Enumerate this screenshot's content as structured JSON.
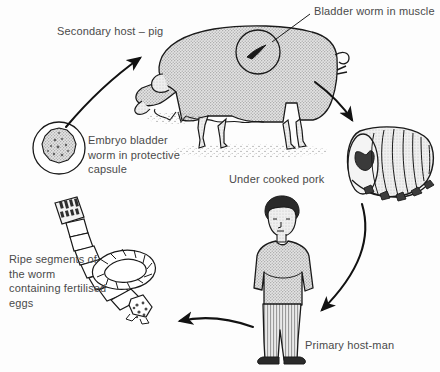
{
  "diagram": {
    "type": "cycle-diagram",
    "background_color": "#fdfdfd",
    "text_color": "#4a4a4a",
    "line_color": "#1a1a1a",
    "fill_color": "#d8d8d8",
    "labels": {
      "secondary_host": "Secondary host – pig",
      "bladder_worm": "Bladder worm in muscle",
      "embryo": "Embryo bladder\nworm in protective\ncapsule",
      "undercooked_pork": "Under cooked pork",
      "ripe_segments": "Ripe segments of\nthe worm\ncontaining fertilised\neggs",
      "primary_host": "Primary host-man"
    },
    "nodes": [
      {
        "id": "embryo-capsule",
        "label": "Embryo bladder worm in protective capsule",
        "shape": "circle"
      },
      {
        "id": "pig",
        "label": "Secondary host – pig",
        "shape": "animal"
      },
      {
        "id": "pork-joint",
        "label": "Under cooked pork",
        "shape": "meat-roll"
      },
      {
        "id": "man",
        "label": "Primary host-man",
        "shape": "person"
      },
      {
        "id": "tapeworm",
        "label": "Ripe segments of the worm containing fertilised eggs",
        "shape": "worm"
      }
    ],
    "arrows": [
      {
        "from": "embryo-capsule",
        "to": "pig",
        "direction": "up-right"
      },
      {
        "from": "pig",
        "to": "pork-joint",
        "direction": "down-right"
      },
      {
        "from": "pork-joint",
        "to": "man",
        "direction": "down-left"
      },
      {
        "from": "man",
        "to": "tapeworm",
        "direction": "left"
      }
    ],
    "annotations": [
      {
        "id": "bladder-worm-leader",
        "label": "Bladder worm in muscle",
        "points_to": "pig-muscle-circle"
      }
    ]
  }
}
